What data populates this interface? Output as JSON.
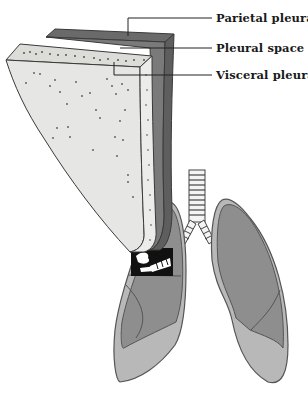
{
  "diagram": {
    "labels": {
      "parietal": "Parietal pleura",
      "space": "Pleural space",
      "visceral": "Visceral pleura"
    },
    "colors": {
      "parietal": "#7a7a7a",
      "parietal_dark": "#5e5e5e",
      "visceral": "#e4e4e2",
      "lung_outer": "#b8b8b8",
      "lung_inner": "#8e8e8e",
      "outline": "#444444"
    }
  }
}
